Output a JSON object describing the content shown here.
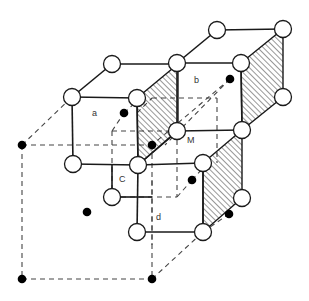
{
  "figure": {
    "labels": [
      {
        "id": "a",
        "text": "a"
      },
      {
        "id": "b",
        "text": "b"
      },
      {
        "id": "c",
        "text": "C"
      },
      {
        "id": "d",
        "text": "d"
      },
      {
        "id": "m",
        "text": "M"
      }
    ],
    "legend_semantics": {
      "open_circle": "lattice atom",
      "filled_dot": "second-species atom",
      "hatched_face": "shaded plane",
      "dashed_line": "hidden / reference cell edge"
    },
    "colors": {
      "line": "#1a1a1a",
      "dashed": "#444444",
      "atom_open_fill": "#ffffff",
      "atom_filled": "#000000",
      "background": "#ffffff"
    }
  }
}
